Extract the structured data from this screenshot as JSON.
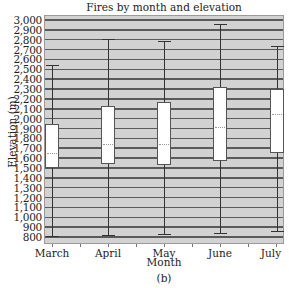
{
  "chart_data": {
    "type": "box",
    "title": "Fires by month and elevation",
    "xlabel": "Month",
    "ylabel": "Elevation (m)",
    "caption": "(b)",
    "categories": [
      "March",
      "April",
      "May",
      "June",
      "July"
    ],
    "ylim": [
      740,
      3050
    ],
    "yticks": [
      "3,000",
      "2,900",
      "2,800",
      "2,700",
      "2,600",
      "2,500",
      "2,400",
      "2,300",
      "2,200",
      "2,100",
      "2,000",
      "1,900",
      "1,800",
      "1,700",
      "1,600",
      "1,500",
      "1,400",
      "1,300",
      "1,200",
      "1,100",
      "1,000",
      "900",
      "800"
    ],
    "grid": true,
    "series": [
      {
        "category": "March",
        "min": 810,
        "q1": 1500,
        "median": 1650,
        "q3": 1950,
        "max": 2540
      },
      {
        "category": "April",
        "min": 820,
        "q1": 1540,
        "median": 1740,
        "q3": 2130,
        "max": 2810
      },
      {
        "category": "May",
        "min": 830,
        "q1": 1530,
        "median": 1740,
        "q3": 2170,
        "max": 2790
      },
      {
        "category": "June",
        "min": 840,
        "q1": 1570,
        "median": 1920,
        "q3": 2320,
        "max": 2960
      },
      {
        "category": "July",
        "min": 860,
        "q1": 1650,
        "median": 2050,
        "q3": 2300,
        "max": 2740
      }
    ]
  },
  "colors": {
    "plot_background": "#d2d2d2",
    "gridline": "#5a5a5a",
    "box_fill": "#ffffff",
    "median_line": "#9a9a9a"
  }
}
